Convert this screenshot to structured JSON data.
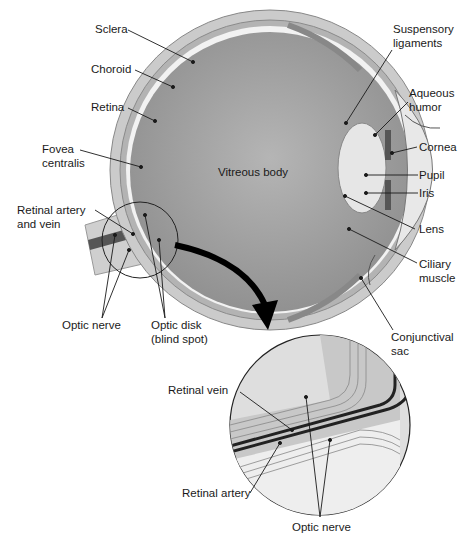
{
  "diagram": {
    "center_label": "Vitreous body",
    "labels_left": [
      {
        "id": "sclera",
        "text": "Sclera"
      },
      {
        "id": "choroid",
        "text": "Choroid"
      },
      {
        "id": "retina",
        "text": "Retina"
      },
      {
        "id": "fovea",
        "line1": "Fovea",
        "line2": "centralis"
      },
      {
        "id": "retinal-artery-vein",
        "line1": "Retinal artery",
        "line2": "and vein"
      }
    ],
    "labels_right": [
      {
        "id": "suspensory",
        "line1": "Suspensory",
        "line2": "ligaments"
      },
      {
        "id": "aqueous",
        "line1": "Aqueous",
        "line2": "humor"
      },
      {
        "id": "cornea",
        "text": "Cornea"
      },
      {
        "id": "pupil",
        "text": "Pupil"
      },
      {
        "id": "iris",
        "text": "Iris"
      },
      {
        "id": "lens",
        "text": "Lens"
      },
      {
        "id": "ciliary",
        "line1": "Ciliary",
        "line2": "muscle"
      },
      {
        "id": "conjunctival",
        "line1": "Conjunctival",
        "line2": "sac"
      }
    ],
    "labels_bottom": [
      {
        "id": "optic-nerve",
        "text": "Optic nerve"
      },
      {
        "id": "optic-disk",
        "line1": "Optic disk",
        "line2": "(blind spot)"
      }
    ],
    "inset": {
      "labels": [
        {
          "id": "retinal-vein",
          "text": "Retinal vein"
        },
        {
          "id": "retinal-artery",
          "text": "Retinal artery"
        },
        {
          "id": "optic-nerve-inset",
          "text": "Optic nerve"
        }
      ]
    },
    "colors": {
      "sclera": "#c9c9c9",
      "choroid": "#a9a9a9",
      "vitreous": "#9a9a9a",
      "lens": "#e6e6e6",
      "line": "#1a1a1a"
    }
  }
}
